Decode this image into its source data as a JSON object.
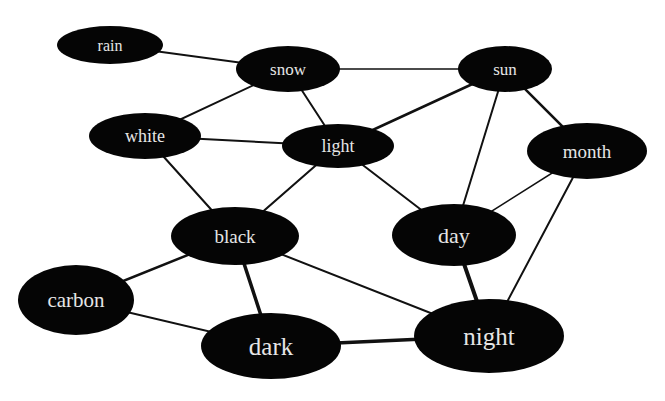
{
  "diagram": {
    "type": "word-association network",
    "node_fill": "#050505",
    "label_color": "#e6e6e6",
    "edge_color": "#111111",
    "nodes": [
      {
        "id": "rain",
        "label": "rain",
        "cx": 110,
        "cy": 45,
        "rx": 53,
        "ry": 19,
        "font": 16
      },
      {
        "id": "snow",
        "label": "snow",
        "cx": 288,
        "cy": 69,
        "rx": 52,
        "ry": 23,
        "font": 17
      },
      {
        "id": "sun",
        "label": "sun",
        "cx": 505,
        "cy": 69,
        "rx": 47,
        "ry": 23,
        "font": 17
      },
      {
        "id": "white",
        "label": "white",
        "cx": 145,
        "cy": 136,
        "rx": 56,
        "ry": 23,
        "font": 18
      },
      {
        "id": "light",
        "label": "light",
        "cx": 338,
        "cy": 146,
        "rx": 56,
        "ry": 22,
        "font": 18
      },
      {
        "id": "month",
        "label": "month",
        "cx": 587,
        "cy": 151,
        "rx": 60,
        "ry": 28,
        "font": 19
      },
      {
        "id": "black",
        "label": "black",
        "cx": 235,
        "cy": 236,
        "rx": 64,
        "ry": 29,
        "font": 19
      },
      {
        "id": "day",
        "label": "day",
        "cx": 454,
        "cy": 235,
        "rx": 62,
        "ry": 31,
        "font": 22
      },
      {
        "id": "carbon",
        "label": "carbon",
        "cx": 76,
        "cy": 300,
        "rx": 58,
        "ry": 35,
        "font": 21
      },
      {
        "id": "dark",
        "label": "dark",
        "cx": 271,
        "cy": 346,
        "rx": 70,
        "ry": 33,
        "font": 25
      },
      {
        "id": "night",
        "label": "night",
        "cx": 489,
        "cy": 336,
        "rx": 75,
        "ry": 37,
        "font": 25
      }
    ],
    "edges": [
      {
        "from": "rain",
        "to": "snow",
        "width": 2
      },
      {
        "from": "snow",
        "to": "sun",
        "width": 1.5
      },
      {
        "from": "snow",
        "to": "white",
        "width": 2
      },
      {
        "from": "snow",
        "to": "light",
        "width": 2
      },
      {
        "from": "white",
        "to": "light",
        "width": 2
      },
      {
        "from": "white",
        "to": "black",
        "width": 2
      },
      {
        "from": "light",
        "to": "sun",
        "width": 2.5
      },
      {
        "from": "light",
        "to": "black",
        "width": 2
      },
      {
        "from": "light",
        "to": "day",
        "width": 2
      },
      {
        "from": "sun",
        "to": "day",
        "width": 2
      },
      {
        "from": "sun",
        "to": "month",
        "width": 2.5
      },
      {
        "from": "month",
        "to": "day",
        "width": 1.5
      },
      {
        "from": "month",
        "to": "night",
        "width": 2
      },
      {
        "from": "black",
        "to": "carbon",
        "width": 2.5
      },
      {
        "from": "black",
        "to": "dark",
        "width": 3.5
      },
      {
        "from": "black",
        "to": "night",
        "width": 2
      },
      {
        "from": "carbon",
        "to": "dark",
        "width": 2
      },
      {
        "from": "dark",
        "to": "night",
        "width": 3.5
      },
      {
        "from": "day",
        "to": "night",
        "width": 4
      }
    ]
  }
}
